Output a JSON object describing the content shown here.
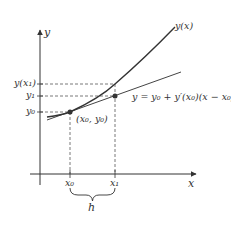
{
  "diagram": {
    "colors": {
      "curve": "#333333",
      "tangent": "#444444",
      "axes": "#333333",
      "dashed": "#555555",
      "points": "#333333",
      "text": "#333333"
    },
    "axes": {
      "x_label": "x",
      "y_label": "y"
    },
    "curve_label": "y(x)",
    "tangent_label": "y = y₀ + y′(x₀)(x − x₀)",
    "points": [
      {
        "label": "(x₀, y₀)",
        "name": "point-x0-y0"
      },
      {
        "label": "",
        "name": "point-x1-y1"
      }
    ],
    "y_ticks": [
      {
        "label": "y(x₁)"
      },
      {
        "label": "y₁"
      },
      {
        "label": "y₀"
      }
    ],
    "x_ticks": [
      {
        "label": "x₀"
      },
      {
        "label": "x₁"
      }
    ],
    "step_label": "h"
  }
}
